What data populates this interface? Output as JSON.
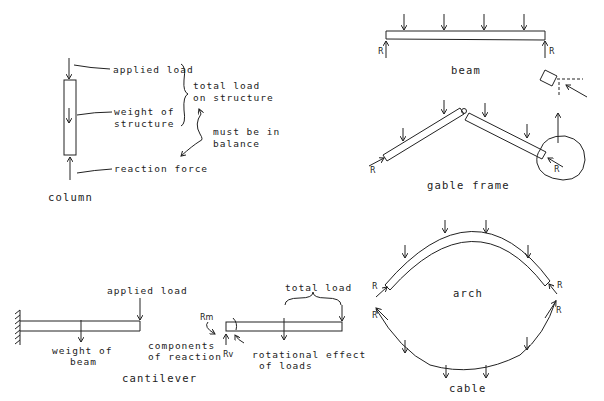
{
  "column": {
    "caption": "column",
    "labels": {
      "applied_load": "applied load",
      "weight_line1": "weight of",
      "weight_line2": "structure",
      "reaction": "reaction force",
      "total_line1": "total load",
      "total_line2": "on structure",
      "balance_line1": "must be in",
      "balance_line2": "balance"
    }
  },
  "beam": {
    "caption": "beam",
    "reaction_label": "R",
    "load_arrows": 4
  },
  "gable_frame": {
    "caption": "gable frame",
    "reaction_label": "R",
    "load_arrows": 4
  },
  "cantilever": {
    "caption": "cantilever",
    "labels": {
      "applied_load": "applied load",
      "weight_line1": "weight of",
      "weight_line2": "beam",
      "total_load": "total load",
      "components_line1": "components",
      "components_line2": "of reaction",
      "rotational_line1": "rotational effect",
      "rotational_line2": "of loads",
      "rm": "Rm",
      "rv": "Rv"
    }
  },
  "arch": {
    "caption": "arch",
    "reaction_label": "R",
    "load_arrows": 4
  },
  "cable": {
    "caption": "cable",
    "reaction_label": "R",
    "load_arrows": 4
  },
  "colors": {
    "ink": "#222222",
    "background": "#ffffff"
  }
}
